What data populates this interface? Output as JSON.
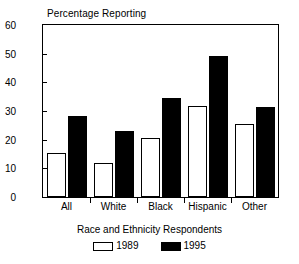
{
  "chart_data": {
    "type": "bar",
    "title": "Percentage Reporting",
    "xlabel": "Race and Ethnicity Respondents",
    "ylabel": "",
    "categories": [
      "All",
      "White",
      "Black",
      "Hispanic",
      "Other"
    ],
    "series": [
      {
        "name": "1989",
        "values": [
          15.5,
          12.0,
          20.5,
          31.7,
          25.3
        ],
        "color": "#ffffff"
      },
      {
        "name": "1995",
        "values": [
          28.3,
          23.0,
          34.7,
          49.3,
          31.3
        ],
        "color": "#000000"
      }
    ],
    "ylim": [
      0,
      60
    ],
    "yticks": [
      0,
      10,
      20,
      30,
      40,
      50,
      60
    ],
    "ytick_labels": [
      "0",
      "10",
      "20",
      "30",
      "40",
      "50",
      "60"
    ],
    "grid": false,
    "legend_position": "bottom",
    "legend_entries": [
      "1989",
      "1995"
    ]
  }
}
